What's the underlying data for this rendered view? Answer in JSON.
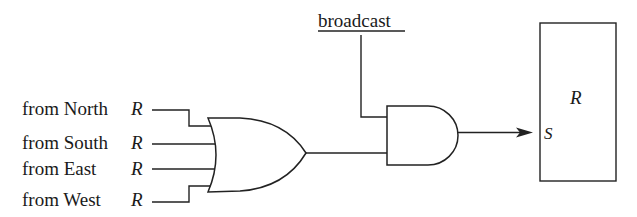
{
  "diagram": {
    "type": "logic-circuit",
    "inputs": [
      {
        "label": "from North",
        "signal": "R"
      },
      {
        "label": "from South",
        "signal": "R"
      },
      {
        "label": "from East",
        "signal": "R"
      },
      {
        "label": "from West",
        "signal": "R"
      }
    ],
    "control": {
      "label": "broadcast"
    },
    "gates": [
      {
        "type": "OR",
        "inputs": 4
      },
      {
        "type": "AND",
        "inputs": 2
      }
    ],
    "register": {
      "name": "R",
      "port": "S"
    }
  }
}
